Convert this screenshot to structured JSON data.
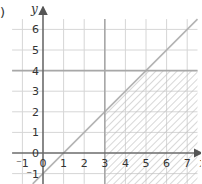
{
  "part_label": ")",
  "chart_data": {
    "type": "line",
    "title": "",
    "xlabel": "x",
    "ylabel": "y",
    "xlim": [
      -1.5,
      7.5
    ],
    "ylim": [
      -1.5,
      6.5
    ],
    "grid": true,
    "x_ticks": [
      "-1",
      "0",
      "1",
      "2",
      "3",
      "4",
      "5",
      "6",
      "7"
    ],
    "y_ticks": [
      "-1",
      "0",
      "1",
      "2",
      "3",
      "4",
      "5",
      "6"
    ],
    "series": [
      {
        "name": "y = x - 1",
        "kind": "line",
        "x": [
          -0.5,
          7.5
        ],
        "y": [
          -1.5,
          6.5
        ]
      },
      {
        "name": "x = 3",
        "kind": "vertical",
        "x": [
          3,
          3
        ],
        "y": [
          -1.5,
          6.5
        ]
      },
      {
        "name": "y = 4",
        "kind": "horizontal",
        "x": [
          -1.5,
          7.5
        ],
        "y": [
          4,
          4
        ]
      }
    ],
    "shaded_region": {
      "description": "Region satisfying x >= 3, y <= 4, y <= x - 1 (hatched)",
      "vertices": [
        [
          3,
          -1.5
        ],
        [
          3,
          2
        ],
        [
          5,
          4
        ],
        [
          7.5,
          4
        ],
        [
          7.5,
          -1.5
        ]
      ],
      "fill": "diagonal-hatch"
    },
    "colors": {
      "grid": "#d6d6d6",
      "axes": "#6b6b6b",
      "line": "#b3b3b3",
      "boundary": "#a8a8a8",
      "hatch": "#bdbdbd"
    }
  }
}
